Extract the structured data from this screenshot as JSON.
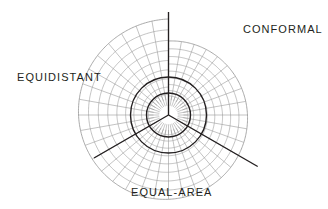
{
  "figure": {
    "name": "map-projection-property-spiral",
    "title_visible": false,
    "background_color": "#ffffff",
    "grid_color": "#9a9a9a",
    "accent_color": "#231f20",
    "center": {
      "x": 168.5,
      "y": 115.0
    },
    "labels": {
      "conformal": "CONFORMAL",
      "equidistant": "EQUIDISTANT",
      "equal_area": "EQUAL-AREA"
    }
  },
  "chart_data": {
    "type": "line",
    "title": "",
    "subtitle": "",
    "xlabel": "",
    "ylabel": "",
    "grid": true,
    "legend_position": "none",
    "coordinate_system": "polar-logarithmic-spiral",
    "center_px": {
      "x": 168.5,
      "y": 115.0
    },
    "spiral": {
      "description": "Logarithmic spiral outer boundary; radius grows with angle, cut at top (90 deg)",
      "start_angle_deg": 90,
      "total_sweep_deg": 360,
      "r_start_px": 74,
      "r_end_px": 96,
      "ring_count": 9,
      "r_inner_hub_px": 15,
      "radial_line_count": 36,
      "radial_step_deg": 10
    },
    "hub_circles": [
      {
        "name": "inner-dark-circle",
        "radius_px": 22,
        "stroke": "#231f20",
        "stroke_width": 1.4
      },
      {
        "name": "outer-dark-circle",
        "radius_px": 38,
        "stroke": "#231f20",
        "stroke_width": 1.4
      }
    ],
    "property_spokes": [
      {
        "name": "conformal",
        "angle_deg": 90,
        "label": "CONFORMAL",
        "r_from_px": 0,
        "r_to_px": 103,
        "emphasis": "dark"
      },
      {
        "name": "equal-area",
        "angle_deg": 330,
        "label": "EQUAL-AREA",
        "r_from_px": 0,
        "r_to_px": 103,
        "emphasis": "dark"
      },
      {
        "name": "equidistant",
        "angle_deg": 210,
        "label": "EQUIDISTANT",
        "r_from_px": 0,
        "r_to_px": 86,
        "emphasis": "dark"
      }
    ],
    "annotations": [
      {
        "text": "CONFORMAL",
        "x_px": 243,
        "y_px": 24,
        "anchor": "start"
      },
      {
        "text": "EQUIDISTANT",
        "x_px": 17,
        "y_px": 72,
        "anchor": "start"
      },
      {
        "text": "EQUAL-AREA",
        "x_px": 131,
        "y_px": 187,
        "anchor": "start"
      }
    ],
    "categories": [
      "CONFORMAL",
      "EQUIDISTANT",
      "EQUAL-AREA"
    ],
    "values": [
      90,
      210,
      330
    ]
  }
}
